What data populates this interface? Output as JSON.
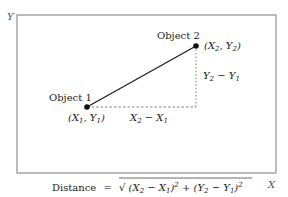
{
  "axes": {
    "y_label": "Y",
    "x_label": "X"
  },
  "objects": [
    {
      "name": "Object 1",
      "coord_label": "(X1, Y1)",
      "x": 87,
      "y": 107
    },
    {
      "name": "Object 2",
      "coord_label": "(X2, Y2)",
      "x": 196,
      "y": 46
    }
  ],
  "labels": {
    "object1": "Object 1",
    "object2": "Object 2",
    "dx": "X2 − X1",
    "dy": "Y2 − Y1"
  },
  "formula": {
    "lhs": "Distance",
    "equals": "=",
    "rhs": "√ (X2 − X1)² + (Y2 − Y1)²"
  },
  "colors": {
    "frame": "#999999",
    "line": "#222222",
    "dashed": "#777777"
  }
}
